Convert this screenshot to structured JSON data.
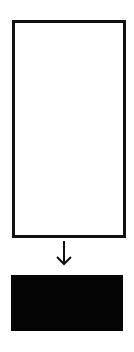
{
  "diagram": {
    "nodes": [
      {
        "id": "source",
        "shape": "rectangle",
        "fill": "#ffffff",
        "stroke": "#111111",
        "label": ""
      },
      {
        "id": "target",
        "shape": "rectangle",
        "fill": "#050505",
        "stroke": "#050505",
        "label": ""
      }
    ],
    "edges": [
      {
        "from": "source",
        "to": "target",
        "style": "arrow-down",
        "color": "#111111"
      }
    ]
  }
}
